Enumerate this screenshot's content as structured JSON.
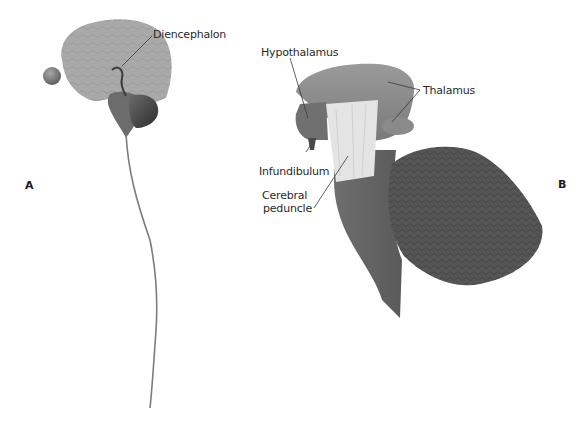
{
  "figure": {
    "panels": [
      {
        "id": "A",
        "label": "A"
      },
      {
        "id": "B",
        "label": "B"
      }
    ],
    "labels": {
      "diencephalon": "Diencephalon",
      "hypothalamus": "Hypothalamus",
      "thalamus": "Thalamus",
      "infundibulum": "Infundibulum",
      "cerebral_peduncle_line1": "Cerebral",
      "cerebral_peduncle_line2": "peduncle"
    }
  }
}
